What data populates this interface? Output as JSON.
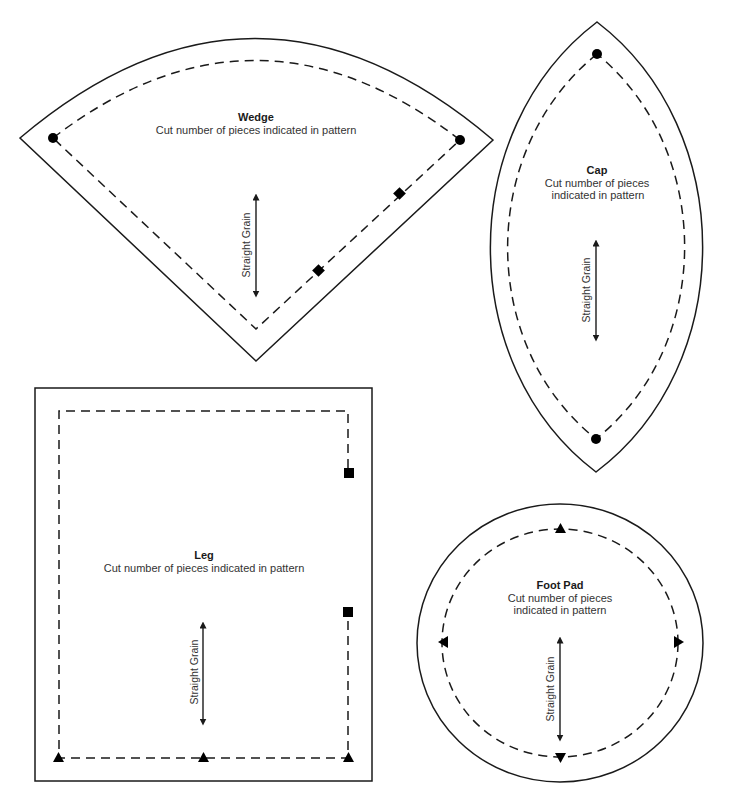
{
  "diagram": {
    "type": "sewing-pattern-pieces",
    "pieces": {
      "wedge": {
        "title": "Wedge",
        "instruction_line1": "Cut number of pieces indicated in pattern",
        "grain_label": "Straight Grain",
        "notches": [
          "circle",
          "circle",
          "diamond",
          "diamond"
        ]
      },
      "cap": {
        "title": "Cap",
        "instruction_line1": "Cut number of pieces",
        "instruction_line2": "indicated in pattern",
        "grain_label": "Straight Grain",
        "notches": [
          "circle",
          "circle"
        ]
      },
      "leg": {
        "title": "Leg",
        "instruction_line1": "Cut number of pieces indicated in pattern",
        "grain_label": "Straight Grain",
        "notches": [
          "square",
          "square",
          "triangle",
          "triangle",
          "triangle"
        ]
      },
      "foot_pad": {
        "title": "Foot Pad",
        "instruction_line1": "Cut number of pieces",
        "instruction_line2": "indicated in pattern",
        "grain_label": "Straight Grain",
        "notches": [
          "triangle-up",
          "triangle-left",
          "triangle-right",
          "triangle-down"
        ]
      }
    },
    "legend": {
      "cut_line": "solid outline",
      "seam_line": "dashed line"
    }
  }
}
